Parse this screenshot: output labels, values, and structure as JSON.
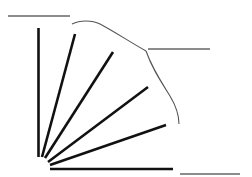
{
  "diagram": {
    "width": 252,
    "height": 177,
    "background": "#ffffff",
    "colors": {
      "ray": "#111111",
      "arc": "#555555",
      "label_line": "#666666"
    },
    "rays": [
      {
        "x1": 38.5,
        "y1": 157,
        "x2": 38.5,
        "y2": 28
      },
      {
        "x1": 42,
        "y1": 157,
        "x2": 75,
        "y2": 34
      },
      {
        "x1": 45,
        "y1": 158,
        "x2": 113,
        "y2": 52
      },
      {
        "x1": 48,
        "y1": 162,
        "x2": 148,
        "y2": 87
      },
      {
        "x1": 50,
        "y1": 165,
        "x2": 166,
        "y2": 125
      },
      {
        "x1": 50,
        "y1": 169,
        "x2": 173,
        "y2": 169
      }
    ],
    "arcs": [
      {
        "d": "M72,24 C80,20 92,20 100,24 C115,32 130,42 146,51"
      },
      {
        "d": "M146,51 C152,68 160,80 170,96 C176,106 179,114 179,124"
      }
    ],
    "label_lines": [
      {
        "x1": 8,
        "y1": 16,
        "x2": 70,
        "y2": 16
      },
      {
        "x1": 148,
        "y1": 49,
        "x2": 210,
        "y2": 49
      },
      {
        "x1": 180,
        "y1": 174,
        "x2": 240,
        "y2": 174
      }
    ]
  }
}
